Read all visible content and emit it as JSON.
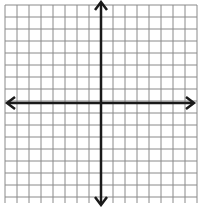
{
  "diagram": {
    "type": "coordinate-grid",
    "grid": {
      "columns": 16,
      "rows": 16,
      "cell_size_px": 12,
      "origin_x": 5,
      "origin_y": 5,
      "line_color": "#8a8a8a"
    },
    "axes": {
      "x_axis_y": 103,
      "y_axis_x": 101,
      "color": "#1a1a1a",
      "arrows": [
        "left",
        "right",
        "up",
        "down"
      ]
    }
  }
}
